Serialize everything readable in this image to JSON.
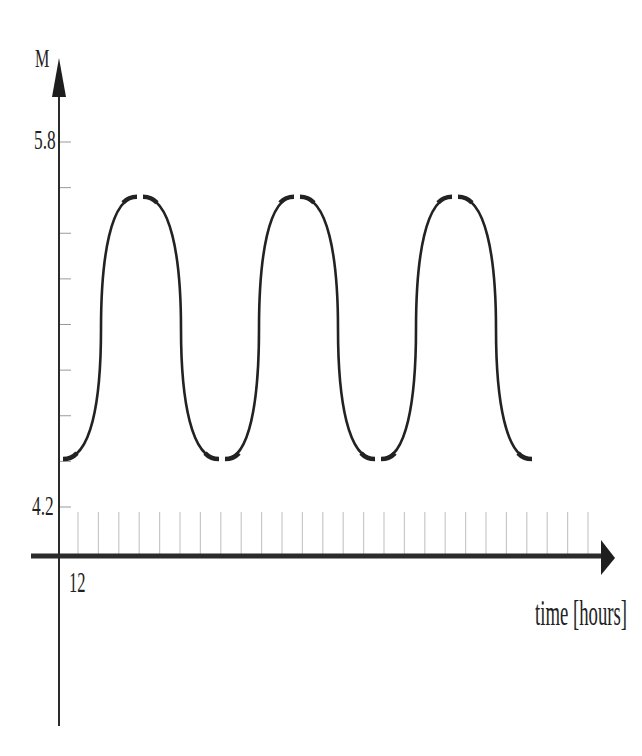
{
  "chart_data": {
    "type": "line",
    "title": "",
    "xlabel": "time [hours]",
    "ylabel": "M",
    "y_tick_labels": [
      "5.8",
      "4.2"
    ],
    "x_tick_labels": [
      "12"
    ],
    "ylim": [
      4.2,
      5.8
    ],
    "y_minor_step": 0.2,
    "x_minor_tick_count": 26,
    "grid": false,
    "legend": null,
    "series": [
      {
        "name": "M",
        "description": "periodic rounded-square-like oscillation, starting at a trough",
        "x_px": [
          63,
          101,
          140,
          181,
          222,
          259,
          297,
          338,
          378,
          416,
          455,
          496,
          535
        ],
        "values": [
          4.41,
          4.98,
          5.56,
          4.98,
          4.41,
          4.98,
          5.56,
          4.98,
          4.41,
          4.98,
          5.56,
          4.98,
          4.41
        ],
        "min": 4.41,
        "max": 5.56,
        "peaks": 3,
        "troughs": 4
      }
    ]
  },
  "labels": {
    "y_axis": "M",
    "y_top": "5.8",
    "y_bottom": "4.2",
    "x_first": "12",
    "x_axis": "time [hours]"
  },
  "colors": {
    "axis": "#2b2b2b",
    "tick": "#c9c9c9",
    "curve": "#222222"
  }
}
